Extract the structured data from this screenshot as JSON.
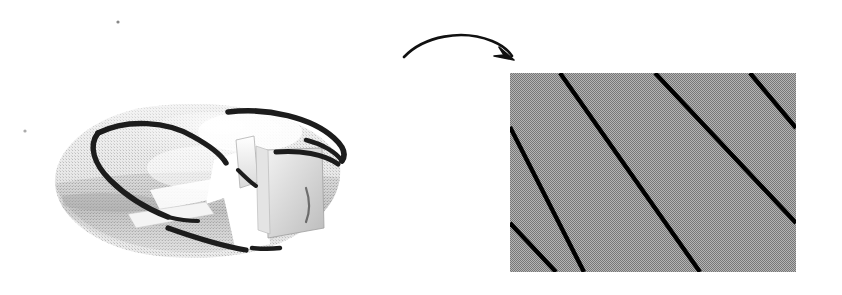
{
  "figure": {
    "title": "Cut-open torus unfolded to a rectangle with parallel diagonal curves",
    "background_color": "#ffffff",
    "width": 842,
    "height": 295,
    "style_note": "scanned halftone / dithered grayscale line art"
  },
  "left_panel": {
    "name": "cut-open-torus",
    "description": "Flattened torus (donut) shown in perspective with a wedge-shaped sector cut out on the right side, revealing the square cross-section. Thick dark curves wind helically around the torus surface.",
    "bounds": {
      "x": 55,
      "y": 104,
      "width": 287,
      "height": 155
    },
    "fill_color": "#d8d8d8",
    "shade_color": "#bdbdbd",
    "highlight_color": "#f7f7f7",
    "curve_color": "#1a1a1a",
    "curve_count": 5,
    "cut_label": ""
  },
  "arrow": {
    "name": "transformation-arrow",
    "description": "Curved arrow arcing from the torus to the rectangle",
    "start": {
      "x": 404,
      "y": 56
    },
    "end": {
      "x": 512,
      "y": 59
    },
    "color": "#111111",
    "label": ""
  },
  "right_panel": {
    "name": "unfolded-rectangle",
    "description": "Gray rectangle representing the torus cut open and flattened; the curves become straight parallel diagonal line segments.",
    "bounds": {
      "x": 510,
      "y": 73,
      "width": 286,
      "height": 199
    },
    "fill_color": "#9d9d9d",
    "line_color": "#000000",
    "line_count": 5,
    "line_width": 4,
    "line_slope_note": "lines run down and to the right at roughly 45 degrees",
    "line_segments": [
      {
        "id": 1,
        "x1": 510,
        "y1": 127,
        "x2": 584,
        "y2": 272
      },
      {
        "id": 2,
        "x1": 560,
        "y1": 73,
        "x2": 700,
        "y2": 272
      },
      {
        "id": 3,
        "x1": 655,
        "y1": 73,
        "x2": 796,
        "y2": 223
      },
      {
        "id": 4,
        "x1": 750,
        "y1": 73,
        "x2": 796,
        "y2": 128
      },
      {
        "id": 5,
        "x1": 510,
        "y1": 223,
        "x2": 556,
        "y2": 272
      }
    ]
  },
  "artifacts": {
    "name": "scan-specks",
    "specks": [
      {
        "x": 118,
        "y": 22,
        "r": 1.6
      },
      {
        "x": 25,
        "y": 131,
        "r": 1.6
      }
    ],
    "color": "#888888"
  }
}
